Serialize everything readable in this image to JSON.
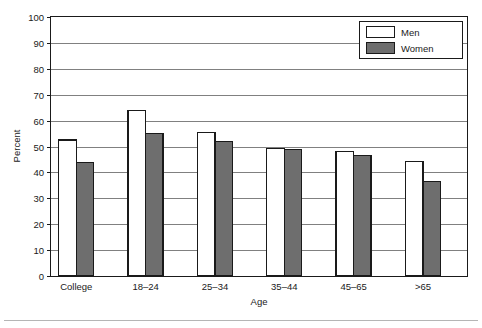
{
  "chart_data": {
    "type": "bar",
    "title": "",
    "subtitle": "",
    "xlabel": "Age",
    "ylabel": "Percent",
    "categories": [
      "College",
      "18–24",
      "25–34",
      "35–44",
      "45–65",
      ">65"
    ],
    "series": [
      {
        "name": "Men",
        "color": "#ffffff",
        "values": [
          52.5,
          63.8,
          55.5,
          49.2,
          48.2,
          44.3
        ]
      },
      {
        "name": "Women",
        "color": "#6e6e6e",
        "values": [
          43.8,
          54.9,
          51.8,
          48.8,
          46.5,
          36.5
        ]
      }
    ],
    "ylim": [
      0,
      100
    ],
    "ytick_step": 10,
    "yticks": [
      "0",
      "10",
      "20",
      "30",
      "40",
      "50",
      "60",
      "70",
      "80",
      "90",
      "100"
    ],
    "grid": "horizontal",
    "legend_position": "top-right",
    "legend_entries": [
      {
        "label": "Men",
        "swatch": "white-filled-black-outline"
      },
      {
        "label": "Women",
        "swatch": "gray-filled-black-outline"
      }
    ]
  },
  "colors": {
    "frame": "#1a1a1a",
    "gridline": "#808080",
    "men_fill": "#ffffff",
    "women_fill": "#6e6e6e",
    "bar_outline": "#1a1a1a",
    "text": "#1a1a1a",
    "footer_rule": "#b5b5b5"
  },
  "footer": {
    "rule_present": true
  }
}
